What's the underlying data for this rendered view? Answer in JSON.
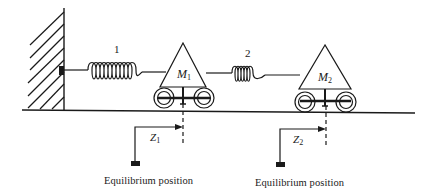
{
  "diagram": {
    "type": "two-mass spring system",
    "colors": {
      "stroke": "#1a1a1a",
      "background": "#ffffff"
    },
    "springs": [
      {
        "label": "1",
        "connects": [
          "wall",
          "M1"
        ]
      },
      {
        "label": "2",
        "connects": [
          "M1",
          "M2"
        ]
      }
    ],
    "masses": [
      {
        "symbol": "M",
        "subscript": "1",
        "displacement_symbol": "Z",
        "displacement_subscript": "1",
        "equilibrium_label": "Equilibrium position"
      },
      {
        "symbol": "M",
        "subscript": "2",
        "displacement_symbol": "Z",
        "displacement_subscript": "2",
        "equilibrium_label": "Equilibrium position"
      }
    ]
  }
}
